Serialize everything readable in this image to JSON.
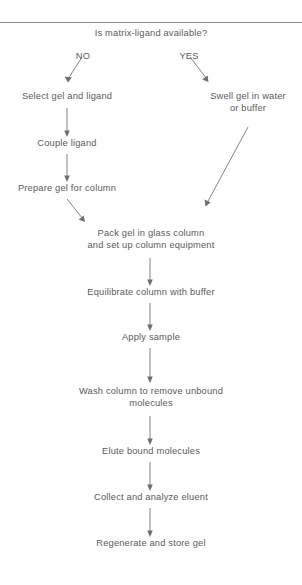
{
  "diagram": {
    "title": "Is matrix-ligand available?",
    "type": "flowchart",
    "orientation": "top-to-bottom",
    "divider_visible": true,
    "text_color": "#5a5a5c",
    "line_color": "#6e6e70",
    "background_color": "#ffffff",
    "branch_labels": [
      {
        "id": "branch-no",
        "label": "NO"
      },
      {
        "id": "branch-yes",
        "label": "YES"
      }
    ],
    "nodes": [
      {
        "id": "node-question",
        "label": "Is matrix-ligand available?"
      },
      {
        "id": "node-select-gel",
        "label": "Select gel and ligand"
      },
      {
        "id": "node-swell-gel",
        "label": "Swell gel in water\nor buffer"
      },
      {
        "id": "node-couple-ligand",
        "label": "Couple ligand"
      },
      {
        "id": "node-prepare-gel",
        "label": "Prepare gel for column"
      },
      {
        "id": "node-pack-gel",
        "label": "Pack gel in glass column\nand set up column equipment"
      },
      {
        "id": "node-equilibrate",
        "label": "Equilibrate column with buffer"
      },
      {
        "id": "node-apply-sample",
        "label": "Apply sample"
      },
      {
        "id": "node-wash-column",
        "label": "Wash column to remove unbound\nmolecules"
      },
      {
        "id": "node-elute",
        "label": "Elute bound molecules"
      },
      {
        "id": "node-collect",
        "label": "Collect and analyze eluent"
      },
      {
        "id": "node-regenerate",
        "label": "Regenerate and store gel"
      }
    ],
    "edges": [
      {
        "id": "edge-question-no",
        "from": "node-question",
        "to": "node-select-gel",
        "label": "NO"
      },
      {
        "id": "edge-question-yes",
        "from": "node-question",
        "to": "node-swell-gel",
        "label": "YES"
      },
      {
        "id": "edge-select-couple",
        "from": "node-select-gel",
        "to": "node-couple-ligand",
        "label": ""
      },
      {
        "id": "edge-couple-prepare",
        "from": "node-couple-ligand",
        "to": "node-prepare-gel",
        "label": ""
      },
      {
        "id": "edge-prepare-pack",
        "from": "node-prepare-gel",
        "to": "node-pack-gel",
        "label": ""
      },
      {
        "id": "edge-swell-pack",
        "from": "node-swell-gel",
        "to": "node-pack-gel",
        "label": ""
      },
      {
        "id": "edge-pack-equilibrate",
        "from": "node-pack-gel",
        "to": "node-equilibrate",
        "label": ""
      },
      {
        "id": "edge-equilibrate-apply",
        "from": "node-equilibrate",
        "to": "node-apply-sample",
        "label": ""
      },
      {
        "id": "edge-apply-wash",
        "from": "node-apply-sample",
        "to": "node-wash-column",
        "label": ""
      },
      {
        "id": "edge-wash-elute",
        "from": "node-wash-column",
        "to": "node-elute",
        "label": ""
      },
      {
        "id": "edge-elute-collect",
        "from": "node-elute",
        "to": "node-collect",
        "label": ""
      },
      {
        "id": "edge-collect-regenerate",
        "from": "node-collect",
        "to": "node-regenerate",
        "label": ""
      }
    ]
  }
}
